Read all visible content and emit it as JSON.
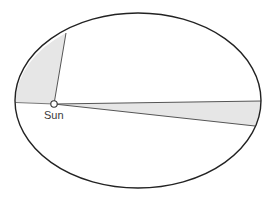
{
  "diagram": {
    "labels": {
      "sun": "Sun"
    },
    "orbit": {
      "cx": 138,
      "cy": 100.5,
      "rx": 123,
      "ry": 87.5,
      "stroke": "#222222"
    },
    "sun_position": {
      "x": 54,
      "y": 104,
      "r": 3
    },
    "swept_areas": [
      {
        "name": "near-aphelion sector (wide)",
        "fill": "#e6e6e6",
        "points_on_orbit": [
          {
            "x": 66,
            "y": 33
          },
          {
            "x": 15.5,
            "y": 102
          }
        ]
      },
      {
        "name": "near-perihelion sector (narrow)",
        "fill": "#e6e6e6",
        "points_on_orbit": [
          {
            "x": 261,
            "y": 101
          },
          {
            "x": 255,
            "y": 126
          }
        ]
      }
    ],
    "colors": {
      "line": "#444444",
      "orbit": "#222222",
      "shade": "#e6e6e6",
      "background": "#ffffff"
    }
  }
}
